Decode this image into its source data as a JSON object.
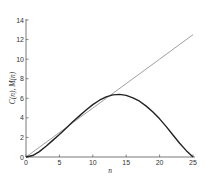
{
  "chart_data": {
    "type": "line",
    "title": "",
    "xlabel": "n",
    "ylabel": "C(n), M(n)",
    "xlim": [
      0,
      25
    ],
    "ylim": [
      0,
      14
    ],
    "grid": false,
    "legend": null,
    "x_ticks": [
      0,
      5,
      10,
      15,
      20,
      25
    ],
    "y_ticks": [
      0,
      2,
      4,
      6,
      8,
      10,
      12,
      14
    ],
    "series": [
      {
        "name": "C(n)",
        "style": "thin gray straight line",
        "color": "#888888",
        "x": [
          0,
          5,
          10,
          15,
          20,
          25
        ],
        "values": [
          0,
          2.5,
          5,
          7.5,
          10,
          12.5
        ]
      },
      {
        "name": "M(n)",
        "style": "thick dark curve",
        "color": "#222222",
        "x": [
          0,
          1,
          2,
          3,
          4,
          5,
          6,
          7,
          8,
          9,
          10,
          11,
          12,
          13,
          14,
          15,
          16,
          17,
          18,
          19,
          20,
          21,
          22,
          23,
          24,
          25
        ],
        "values": [
          0,
          0.15,
          0.55,
          1.1,
          1.7,
          2.3,
          2.95,
          3.6,
          4.2,
          4.8,
          5.35,
          5.8,
          6.15,
          6.35,
          6.4,
          6.3,
          6.05,
          5.7,
          5.2,
          4.6,
          3.9,
          3.1,
          2.25,
          1.4,
          0.65,
          0
        ]
      }
    ]
  },
  "axes": {
    "x_label": "n",
    "y_label": "C(n), M(n)",
    "x_tick_labels": [
      "0",
      "5",
      "10",
      "15",
      "20",
      "25"
    ],
    "y_tick_labels": [
      "0",
      "2",
      "4",
      "6",
      "8",
      "10",
      "12",
      "14"
    ]
  }
}
